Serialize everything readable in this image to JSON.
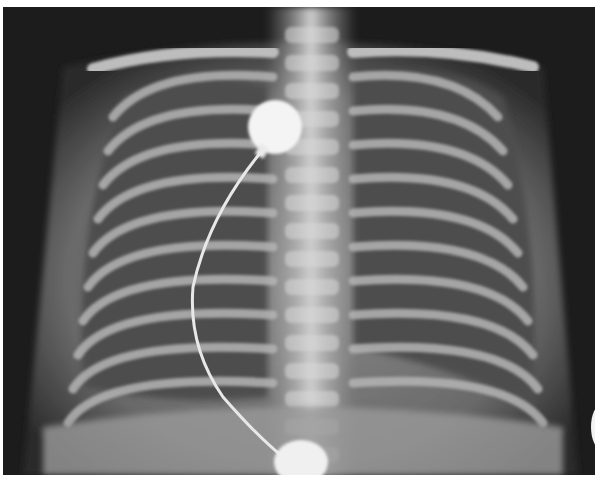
{
  "image": {
    "subject": "Frontal chest radiograph (infant) with ECG electrode leads",
    "description": "Grayscale X-ray showing rib cage, spine, clavicles and two round electrode pads connected by a wire"
  },
  "palette": {
    "background": "#1a1a1a",
    "soft_tissue": "#6f6f6f",
    "bone": "#c8c8c8",
    "lung": "#4a4a4a",
    "electrode": "#f4f4f4"
  }
}
